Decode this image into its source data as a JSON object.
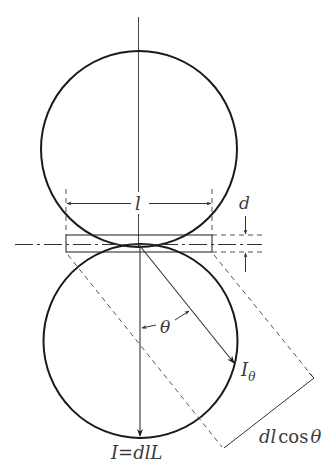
{
  "diagram": {
    "type": "geometric-optics-figure",
    "labels": {
      "length": "l",
      "thickness": "d",
      "angle": "θ",
      "intensity_theta_main": "I",
      "intensity_theta_sub": "θ",
      "intensity_normal": "I=dlL",
      "projected_length_prefix": "dl",
      "projected_length_func": "cos",
      "projected_length_var": "θ"
    },
    "colors": {
      "stroke": "#1a1a1a",
      "thin_stroke": "#333333",
      "dashed": "#555555",
      "text": "#3a3a3a",
      "background": "#ffffff"
    }
  }
}
